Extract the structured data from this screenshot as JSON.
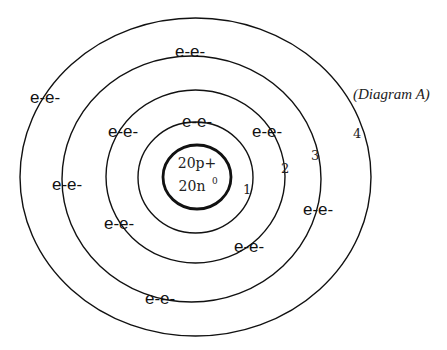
{
  "caption": "(Diagram A)",
  "nucleus": {
    "protons": "20p+",
    "neutrons": "20n",
    "neutron_superscript": "0"
  },
  "shells": [
    {
      "number": "1",
      "label": "1"
    },
    {
      "number": "2",
      "label": "2"
    },
    {
      "number": "3",
      "label": "3"
    },
    {
      "number": "4",
      "label": "4"
    }
  ],
  "electron_labels": [
    {
      "id": "top-outer",
      "text": "e-e-"
    },
    {
      "id": "upper-left-outer",
      "text": "e-e-"
    },
    {
      "id": "left-shell3",
      "text": "e-e-"
    },
    {
      "id": "upper-left-shell2",
      "text": "e-e-"
    },
    {
      "id": "top-shell1",
      "text": "e-e-"
    },
    {
      "id": "upper-right-shell2",
      "text": "e-e-"
    },
    {
      "id": "right-shell3",
      "text": "e-e-"
    },
    {
      "id": "lower-left-shell2",
      "text": "e-e-"
    },
    {
      "id": "lower-right-shell2",
      "text": "e-e-"
    },
    {
      "id": "bottom-shell3",
      "text": "e-e-"
    }
  ],
  "colors": {
    "line": "#111111",
    "background": "#ffffff"
  }
}
